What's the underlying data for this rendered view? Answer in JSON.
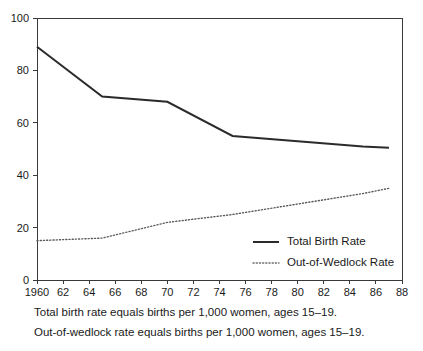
{
  "chart_data": {
    "type": "line",
    "title": "",
    "subtitle": "",
    "xlabel": "",
    "ylabel": "",
    "xlim": [
      1960,
      1988
    ],
    "ylim": [
      0,
      100
    ],
    "grid": false,
    "legend_position": "inside-bottom-right",
    "x_tick_labels": [
      "1960",
      "62",
      "64",
      "66",
      "68",
      "70",
      "72",
      "74",
      "76",
      "78",
      "80",
      "82",
      "84",
      "86",
      "88"
    ],
    "x_ticks": [
      1960,
      1962,
      1964,
      1966,
      1968,
      1970,
      1972,
      1974,
      1976,
      1978,
      1980,
      1982,
      1984,
      1986,
      1988
    ],
    "y_tick_labels": [
      "0",
      "20",
      "40",
      "60",
      "80",
      "100"
    ],
    "y_ticks": [
      0,
      20,
      40,
      60,
      80,
      100
    ],
    "series": [
      {
        "name": "Total Birth Rate",
        "style": "solid",
        "color": "#2b2b2b",
        "x": [
          1960,
          1965,
          1970,
          1975,
          1980,
          1985,
          1987
        ],
        "values": [
          89,
          70,
          68,
          55,
          53,
          51,
          50.5
        ]
      },
      {
        "name": "Out-of-Wedlock Rate",
        "style": "dotted",
        "color": "#5a5a5a",
        "x": [
          1960,
          1965,
          1970,
          1975,
          1980,
          1985,
          1987
        ],
        "values": [
          15,
          16,
          22,
          25,
          29,
          33,
          35
        ]
      }
    ]
  },
  "legend": {
    "items": [
      {
        "label": "Total Birth Rate",
        "style": "solid"
      },
      {
        "label": "Out-of-Wedlock Rate",
        "style": "dotted"
      }
    ]
  },
  "footnotes": {
    "line1": "Total birth rate equals births per 1,000 women, ages 15–19.",
    "line2": "Out-of-wedlock rate equals births per 1,000 women, ages 15–19."
  }
}
